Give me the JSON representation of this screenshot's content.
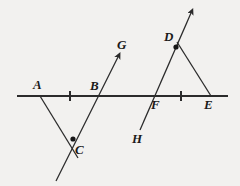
{
  "figure": {
    "background_color": "#f2f1ef",
    "stroke_color": "#2b2b2b",
    "label_color": "#1a1a1a",
    "width": 240,
    "height": 186
  },
  "labels": [
    {
      "id": "A",
      "text": "A",
      "x": 33,
      "y": 78
    },
    {
      "id": "B",
      "text": "B",
      "x": 90,
      "y": 79
    },
    {
      "id": "C",
      "text": "C",
      "x": 75,
      "y": 143
    },
    {
      "id": "D",
      "text": "D",
      "x": 164,
      "y": 30
    },
    {
      "id": "E",
      "text": "E",
      "x": 204,
      "y": 98
    },
    {
      "id": "F",
      "text": "F",
      "x": 151,
      "y": 98
    },
    {
      "id": "G",
      "text": "G",
      "x": 117,
      "y": 38
    },
    {
      "id": "H",
      "text": "H",
      "x": 132,
      "y": 132
    }
  ],
  "geometry": {
    "horizontal_line": {
      "x1": 17,
      "y1": 96,
      "x2": 228,
      "y2": 96
    },
    "tick_marks": [
      {
        "x": 70,
        "y": 96
      },
      {
        "x": 181,
        "y": 96
      }
    ],
    "segment_A_to_C": {
      "x1": 40,
      "y1": 96,
      "x2": 78,
      "y2": 158
    },
    "ray_G": {
      "x1": 56,
      "y1": 181,
      "x2": 118,
      "y2": 57
    },
    "ray_H": {
      "x1": 140,
      "y1": 130,
      "x2": 191,
      "y2": 13
    },
    "segment_D_to_E": {
      "x1": 177,
      "y1": 42,
      "x2": 211,
      "y2": 96
    },
    "dots": [
      {
        "id": "dot-C",
        "x": 73,
        "y": 139,
        "r": 2.6
      },
      {
        "id": "dot-D",
        "x": 176,
        "y": 47,
        "r": 2.6
      }
    ]
  }
}
